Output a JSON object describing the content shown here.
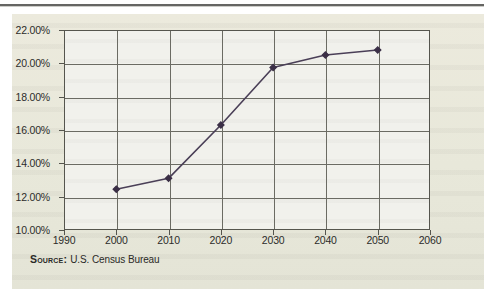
{
  "figure": {
    "panel_bg": "#e9e9dc",
    "plot_bg": "#f1f1ec",
    "frame_color": "#55554e",
    "grid_color": "#6b6b63",
    "series_color": "#4a3f57",
    "marker_color": "#3b2f46"
  },
  "source": {
    "label": "Source:",
    "value": "U.S. Census Bureau"
  },
  "chart_data": {
    "type": "line",
    "title": "",
    "subtitle": "",
    "xlabel": "",
    "ylabel": "",
    "x": [
      2000,
      2010,
      2020,
      2030,
      2040,
      2050
    ],
    "values": [
      12.45,
      13.1,
      16.3,
      19.75,
      20.5,
      20.8
    ],
    "series": [
      {
        "name": "Projected share",
        "x": [
          2000,
          2010,
          2020,
          2030,
          2040,
          2050
        ],
        "values": [
          12.45,
          13.1,
          16.3,
          19.75,
          20.5,
          20.8
        ]
      }
    ],
    "xlim": [
      1990,
      2060
    ],
    "ylim": [
      10,
      22
    ],
    "xticks": [
      1990,
      2000,
      2010,
      2020,
      2030,
      2040,
      2050,
      2060
    ],
    "xticklabels": [
      "1990",
      "2000",
      "2010",
      "2020",
      "2030",
      "2040",
      "2050",
      "2060"
    ],
    "yticks": [
      10,
      12,
      14,
      16,
      18,
      20,
      22
    ],
    "yticklabels": [
      "10.00%",
      "12.00%",
      "14.00%",
      "16.00%",
      "18.00%",
      "20.00%",
      "22.00%"
    ],
    "grid": true,
    "legend": false,
    "legend_position": "none",
    "marker": "diamond",
    "annotations": []
  }
}
